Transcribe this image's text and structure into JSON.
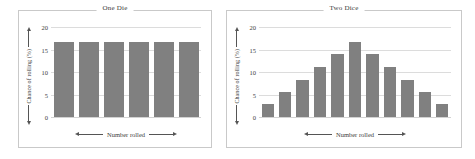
{
  "chart_data": [
    {
      "type": "bar",
      "title": "One Die",
      "xlabel": "Number rolled",
      "ylabel": "Chance of rolling (%)",
      "categories": [
        "1",
        "2",
        "3",
        "4",
        "5",
        "6"
      ],
      "values": [
        16.7,
        16.7,
        16.7,
        16.7,
        16.7,
        16.7
      ],
      "yticks": [
        0,
        5,
        10,
        15,
        20
      ],
      "ylim": [
        0,
        20
      ],
      "grid": true,
      "legend": "none",
      "bar_color": "#808080"
    },
    {
      "type": "bar",
      "title": "Two Dice",
      "xlabel": "Number rolled",
      "ylabel": "Chance of rolling (%)",
      "categories": [
        "2",
        "3",
        "4",
        "5",
        "6",
        "7",
        "8",
        "9",
        "10",
        "11",
        "12"
      ],
      "values": [
        2.8,
        5.6,
        8.3,
        11.1,
        13.9,
        16.7,
        13.9,
        11.1,
        8.3,
        5.6,
        2.8
      ],
      "yticks": [
        0,
        5,
        10,
        15,
        20
      ],
      "ylim": [
        0,
        20
      ],
      "grid": true,
      "legend": "none",
      "bar_color": "#808080"
    }
  ],
  "panels": {
    "one_die": {
      "title": "One Die",
      "x_axis_label": "Number rolled",
      "y_axis_label": "Chance of rolling (%)"
    },
    "two_dice": {
      "title": "Two Dice",
      "x_axis_label": "Number rolled",
      "y_axis_label": "Chance of rolling (%)"
    }
  }
}
